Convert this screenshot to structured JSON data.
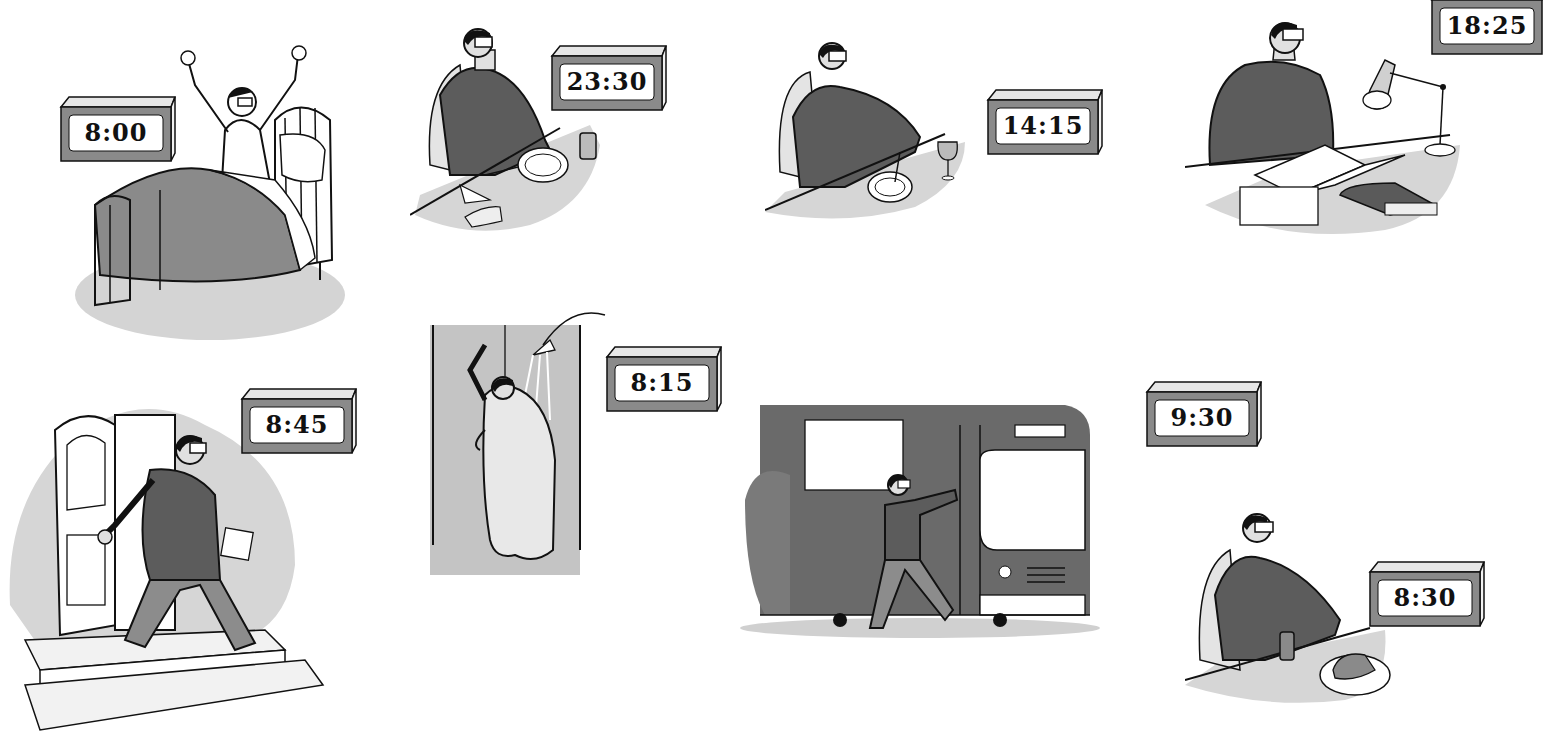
{
  "illustration": {
    "subject": "Daily routine vignettes with clocks",
    "palette": {
      "background": "#ffffff",
      "ink": "#111111",
      "sweater": "#5a5a5a",
      "pants": "#8c8c8c",
      "shade": "#c9c9c9",
      "clock_body": "#8a8a8a",
      "clock_top": "#e6e6e6",
      "clock_face": "#ffffff"
    },
    "scenes": [
      {
        "id": "wake-up",
        "activity": "Waking up and stretching in bed",
        "clock": {
          "time": "8:00"
        }
      },
      {
        "id": "dinner",
        "activity": "Eating dinner at a table",
        "clock": {
          "time": "23:30"
        }
      },
      {
        "id": "lunch",
        "activity": "Eating lunch with a glass of wine",
        "clock": {
          "time": "14:15"
        }
      },
      {
        "id": "reading",
        "activity": "Reading at a desk under a lamp",
        "clock": {
          "time": "18:25"
        }
      },
      {
        "id": "leave-home",
        "activity": "Walking out the front door",
        "clock": {
          "time": "8:45"
        }
      },
      {
        "id": "shower",
        "activity": "Taking a shower",
        "clock": {
          "time": "8:15"
        }
      },
      {
        "id": "bus",
        "activity": "Getting off the bus",
        "clock": {
          "time": "9:30"
        }
      },
      {
        "id": "breakfast",
        "activity": "Having breakfast with a drink and toast",
        "clock": {
          "time": "8:30"
        }
      }
    ]
  }
}
